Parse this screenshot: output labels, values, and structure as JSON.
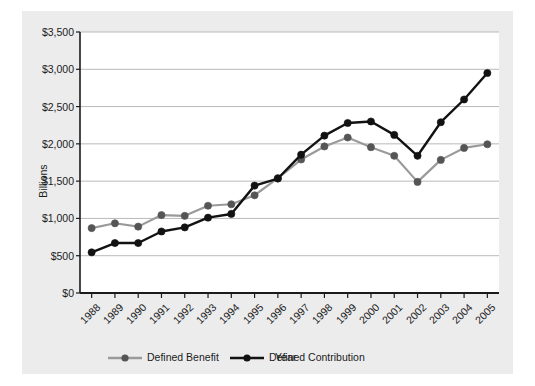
{
  "figure": {
    "panel_bg": "#ececed",
    "page_bg": "#ffffff",
    "axis_color": "#1b1b1b",
    "grid_color": "#b9b9ba"
  },
  "chart_data": {
    "type": "line",
    "title": "",
    "xlabel": "Year",
    "ylabel": "Billions",
    "categories": [
      "1988",
      "1989",
      "1990",
      "1991",
      "1992",
      "1993",
      "1994",
      "1995",
      "1996",
      "1997",
      "1998",
      "1999",
      "2000",
      "2001",
      "2002",
      "2003",
      "2004",
      "2005"
    ],
    "ylim": [
      0,
      3500
    ],
    "yticks": [
      0,
      500,
      1000,
      1500,
      2000,
      2500,
      3000,
      3500
    ],
    "ytick_labels": [
      "$0",
      "$500",
      "$1,000",
      "$1,500",
      "$2,000",
      "$2,500",
      "$3,000",
      "$3,500"
    ],
    "grid": "horizontal",
    "legend_position": "bottom",
    "markers": "circle",
    "series": [
      {
        "name": "Defined Benefit",
        "color": "#9a9a9a",
        "marker_color": "#555555",
        "values": [
          870,
          935,
          890,
          1045,
          1035,
          1170,
          1190,
          1310,
          1540,
          1790,
          1965,
          2085,
          1955,
          1840,
          1490,
          1785,
          1945,
          1995
        ]
      },
      {
        "name": "Defined Contribution",
        "color": "#121212",
        "marker_color": "#121212",
        "values": [
          545,
          670,
          670,
          825,
          880,
          1010,
          1060,
          1440,
          1535,
          1855,
          2110,
          2280,
          2300,
          2120,
          1840,
          2290,
          2595,
          2950
        ]
      }
    ]
  },
  "legend": {
    "items": [
      {
        "label": "Defined Benefit",
        "color": "#9a9a9a"
      },
      {
        "label": "Defined Contribution",
        "color": "#121212"
      }
    ]
  }
}
